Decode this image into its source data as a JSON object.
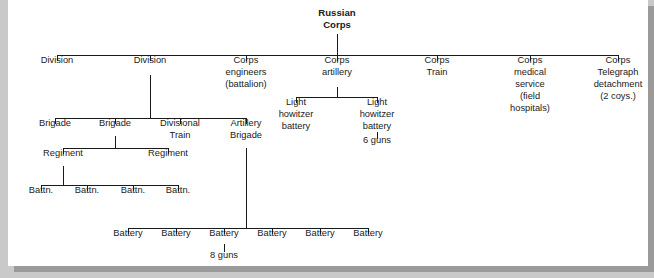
{
  "diagram": {
    "type": "organization-tree",
    "colors": {
      "page_background": "#c9c9c9",
      "sheet_background": "#ffffff",
      "line": "#1a1a1a",
      "text": "#1a1a1a",
      "shadow": "#9a9a9a"
    },
    "root": {
      "id": "russian-corps",
      "lines": [
        "Russian",
        "Corps"
      ],
      "bold": true,
      "cx": 337,
      "text_top": 16
    },
    "level1": {
      "bar_y": 55,
      "bar_x1": 57,
      "bar_x2": 618,
      "nodes": [
        {
          "id": "division-1",
          "lines": [
            "Division"
          ],
          "cx": 57,
          "text_top": 63
        },
        {
          "id": "division-2",
          "lines": [
            "Division"
          ],
          "cx": 150,
          "text_top": 63
        },
        {
          "id": "corps-engineers",
          "lines": [
            "Corps",
            "engineers",
            "(battalion)"
          ],
          "cx": 246,
          "text_top": 63
        },
        {
          "id": "corps-artillery",
          "lines": [
            "Corps",
            "artillery"
          ],
          "cx": 337,
          "text_top": 63
        },
        {
          "id": "corps-train",
          "lines": [
            "Corps",
            "Train"
          ],
          "cx": 437,
          "text_top": 63
        },
        {
          "id": "corps-medical-service",
          "lines": [
            "Corps",
            "medical",
            "service",
            "(field",
            "hospitals)"
          ],
          "cx": 530,
          "text_top": 63
        },
        {
          "id": "corps-telegraph-detachment",
          "lines": [
            "Corps",
            "Telegraph",
            "detachment",
            "(2 coys.)"
          ],
          "cx": 618,
          "text_top": 63
        }
      ]
    },
    "corps_artillery_children": {
      "parent_cx": 337,
      "bar_y": 97,
      "bar_x1": 296,
      "bar_x2": 377,
      "nodes": [
        {
          "id": "light-howitzer-battery-1",
          "lines": [
            "Light",
            "howitzer",
            "battery"
          ],
          "cx": 296,
          "text_top": 105
        },
        {
          "id": "light-howitzer-battery-2",
          "lines": [
            "Light",
            "howitzer",
            "battery"
          ],
          "cx": 377,
          "text_top": 105,
          "note": "6 guns",
          "note_top": 143,
          "note_stub_y1": 132,
          "note_stub_y2": 139
        }
      ]
    },
    "division_children": {
      "parent_cx": 150,
      "bar_y": 118,
      "bar_x1": 55,
      "bar_x2": 246,
      "nodes": [
        {
          "id": "brigade-1",
          "lines": [
            "Brigade"
          ],
          "cx": 55,
          "text_top": 126
        },
        {
          "id": "brigade-2",
          "lines": [
            "Brigade"
          ],
          "cx": 115,
          "text_top": 126
        },
        {
          "id": "divisional-train",
          "lines": [
            "Divisional",
            "Train"
          ],
          "cx": 180,
          "text_top": 126
        },
        {
          "id": "artillery-brigade",
          "lines": [
            "Artillery",
            "Brigade"
          ],
          "cx": 246,
          "text_top": 126
        }
      ]
    },
    "brigade_children": {
      "parent_cx": 115,
      "bar_y": 148,
      "bar_x1": 63,
      "bar_x2": 168,
      "nodes": [
        {
          "id": "regiment-1",
          "lines": [
            "Regiment"
          ],
          "cx": 63,
          "text_top": 156
        },
        {
          "id": "regiment-2",
          "lines": [
            "Regiment"
          ],
          "cx": 168,
          "text_top": 156
        }
      ]
    },
    "regiment_children": {
      "parent_cx": 63,
      "bar_y": 185,
      "bar_x1": 41,
      "bar_x2": 178,
      "nodes": [
        {
          "id": "battn-1",
          "lines": [
            "Battn."
          ],
          "cx": 41,
          "text_top": 193
        },
        {
          "id": "battn-2",
          "lines": [
            "Battn."
          ],
          "cx": 87,
          "text_top": 193
        },
        {
          "id": "battn-3",
          "lines": [
            "Battn."
          ],
          "cx": 133,
          "text_top": 193
        },
        {
          "id": "battn-4",
          "lines": [
            "Battn."
          ],
          "cx": 178,
          "text_top": 193
        }
      ]
    },
    "artillery_brigade_children": {
      "parent_cx": 246,
      "bar_y": 228,
      "bar_x1": 128,
      "bar_x2": 368,
      "nodes": [
        {
          "id": "battery-1",
          "lines": [
            "Battery"
          ],
          "cx": 128,
          "text_top": 236
        },
        {
          "id": "battery-2",
          "lines": [
            "Battery"
          ],
          "cx": 176,
          "text_top": 236
        },
        {
          "id": "battery-3",
          "lines": [
            "Battery"
          ],
          "cx": 224,
          "text_top": 236,
          "note": "8 guns",
          "note_top": 258,
          "note_stub_y1": 244,
          "note_stub_y2": 252
        },
        {
          "id": "battery-4",
          "lines": [
            "Battery"
          ],
          "cx": 272,
          "text_top": 236
        },
        {
          "id": "battery-5",
          "lines": [
            "Battery"
          ],
          "cx": 320,
          "text_top": 236
        },
        {
          "id": "battery-6",
          "lines": [
            "Battery"
          ],
          "cx": 368,
          "text_top": 236
        }
      ]
    }
  }
}
